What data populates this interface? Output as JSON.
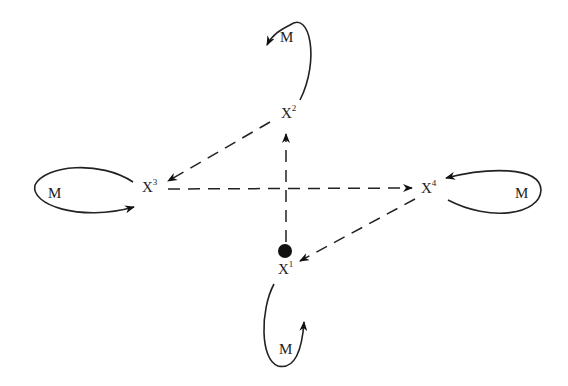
{
  "diagram": {
    "nodes": [
      {
        "id": "x1",
        "label": "X",
        "superscript": "1",
        "marker": "filled-circle"
      },
      {
        "id": "x2",
        "label": "X",
        "superscript": "2"
      },
      {
        "id": "x3",
        "label": "X",
        "superscript": "3"
      },
      {
        "id": "x4",
        "label": "X",
        "superscript": "4"
      }
    ],
    "self_loops": [
      {
        "node": "x2",
        "label": "M"
      },
      {
        "node": "x3",
        "label": "M"
      },
      {
        "node": "x4",
        "label": "M"
      },
      {
        "node": "x1",
        "label": "M"
      }
    ],
    "edges": [
      {
        "from": "x1",
        "to": "x2",
        "style": "dashed"
      },
      {
        "from": "x2",
        "to": "x3",
        "style": "dashed"
      },
      {
        "from": "x3",
        "to": "x4",
        "style": "dashed"
      },
      {
        "from": "x4",
        "to": "x1",
        "style": "dashed"
      }
    ]
  }
}
